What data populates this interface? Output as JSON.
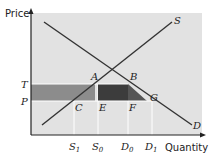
{
  "axes": {
    "y_label": "Price",
    "x_label": "Quantity"
  },
  "curves": {
    "supply": "S",
    "demand": "D"
  },
  "price_labels": {
    "upper": "T",
    "lower": "P"
  },
  "points": {
    "A": "A",
    "B": "B",
    "C": "C",
    "E": "E",
    "F": "F",
    "G": "G"
  },
  "quantity_ticks": [
    {
      "base": "S",
      "sub": "1"
    },
    {
      "base": "S",
      "sub": "0"
    },
    {
      "base": "D",
      "sub": "0"
    },
    {
      "base": "D",
      "sub": "1"
    }
  ],
  "colors": {
    "plot_bg": "#e2e2e2",
    "light_rect": "#8c8c8c",
    "dark_rect": "#3c3c3c",
    "triangle": "#555555",
    "lines": "#333333",
    "grid": "#ffffff"
  }
}
